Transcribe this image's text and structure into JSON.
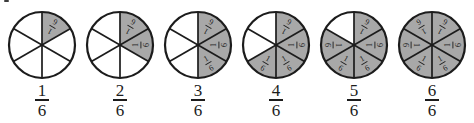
{
  "colors": {
    "shaded": "#a8a8a8",
    "unshaded": "#ffffff",
    "stroke": "#1c1c1c",
    "label": "#1c1c1c"
  },
  "sectors_per_circle": 6,
  "sector_label": {
    "numerator": "1",
    "denominator": "6"
  },
  "figures": [
    {
      "id": "one-sixth",
      "shaded_count": 1,
      "fraction": {
        "numerator": "1",
        "denominator": "6"
      }
    },
    {
      "id": "two-sixths",
      "shaded_count": 2,
      "fraction": {
        "numerator": "2",
        "denominator": "6"
      }
    },
    {
      "id": "three-sixths",
      "shaded_count": 3,
      "fraction": {
        "numerator": "3",
        "denominator": "6"
      }
    },
    {
      "id": "four-sixths",
      "shaded_count": 4,
      "fraction": {
        "numerator": "4",
        "denominator": "6"
      }
    },
    {
      "id": "five-sixths",
      "shaded_count": 5,
      "fraction": {
        "numerator": "5",
        "denominator": "6"
      }
    },
    {
      "id": "six-sixths",
      "shaded_count": 6,
      "fraction": {
        "numerator": "6",
        "denominator": "6"
      }
    }
  ]
}
